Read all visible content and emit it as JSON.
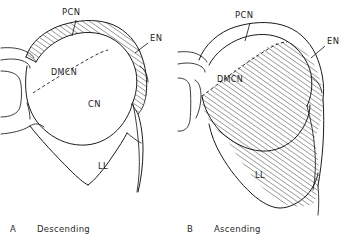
{
  "figure": {
    "type": "anatomical-line-diagram",
    "background_color": "#ffffff",
    "ink_color": "#1a1a1a"
  },
  "panels": [
    {
      "id": "A",
      "letter": "A",
      "caption": "Descending",
      "hatched_region": "peripheral band",
      "labels": {
        "pcn": "PCN",
        "en": "EN",
        "dmcn": "DMCN",
        "cn": "CN",
        "ll": "LL"
      }
    },
    {
      "id": "B",
      "letter": "B",
      "caption": "Ascending",
      "hatched_region": "central core",
      "labels": {
        "pcn": "PCN",
        "en": "EN",
        "dmcn": "DMCN",
        "ll": "LL"
      }
    }
  ],
  "legend_terms": {
    "PCN": "PCN",
    "EN": "EN",
    "DMCN": "DMCN",
    "CN": "CN",
    "LL": "LL"
  }
}
